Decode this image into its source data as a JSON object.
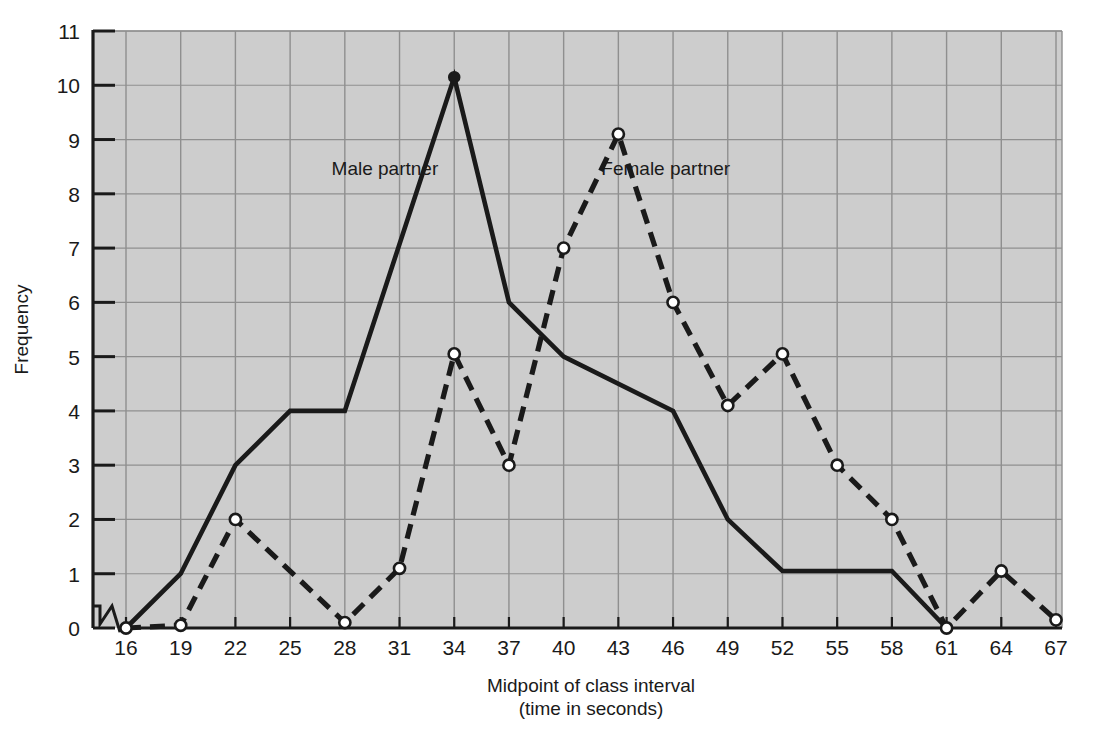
{
  "chart_data": {
    "type": "line",
    "title": "",
    "subtitle": "",
    "xlabel": "Midpoint of class interval",
    "xlabel2": "(time in seconds)",
    "ylabel": "Frequency",
    "x": [
      16,
      19,
      22,
      25,
      28,
      31,
      34,
      37,
      40,
      43,
      46,
      49,
      52,
      55,
      58,
      61,
      64,
      67
    ],
    "xticks": [
      "16",
      "19",
      "22",
      "25",
      "28",
      "31",
      "34",
      "37",
      "40",
      "43",
      "46",
      "49",
      "52",
      "55",
      "58",
      "61",
      "64",
      "67"
    ],
    "yticks": [
      "0",
      "1",
      "2",
      "3",
      "4",
      "5",
      "6",
      "7",
      "8",
      "9",
      "10",
      "11"
    ],
    "xlim": [
      16,
      67
    ],
    "ylim": [
      0,
      11
    ],
    "grid": true,
    "legend_position": "inline-annotation",
    "axis_break_x": true,
    "series": [
      {
        "name": "Male partner",
        "style": "solid",
        "marker": "filled-circle",
        "color": "#1a1a1a",
        "x": [
          16,
          19,
          22,
          25,
          28,
          34,
          37,
          40,
          46,
          49,
          52,
          55,
          58,
          61
        ],
        "values": [
          0,
          1,
          3,
          4,
          4,
          10.15,
          6,
          5,
          4,
          2,
          1.05,
          1.05,
          1.05,
          0
        ]
      },
      {
        "name": "Female partner",
        "style": "dashed",
        "marker": "open-circle",
        "color": "#1a1a1a",
        "x": [
          16,
          19,
          22,
          28,
          31,
          34,
          37,
          40,
          43,
          46,
          49,
          52,
          55,
          58,
          61,
          64,
          67
        ],
        "values": [
          0,
          0.05,
          2,
          0.1,
          1.1,
          5.05,
          3,
          7,
          9.1,
          6,
          4.1,
          5.05,
          3,
          2,
          0,
          1.05,
          0.15
        ]
      }
    ],
    "annotations": [
      {
        "text": "Male partner",
        "x": 30.2,
        "y": 8.35
      },
      {
        "text": "Female partner",
        "x": 45.6,
        "y": 8.35
      }
    ],
    "colors": {
      "plot_background": "#cdcdcd",
      "grid": "#8f8f8f",
      "axis": "#1a1a1a",
      "page_background": "#ffffff",
      "text": "#1a1a1a"
    }
  }
}
